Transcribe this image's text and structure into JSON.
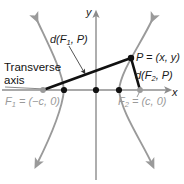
{
  "figure": {
    "colors": {
      "curve": "#9a9a9a",
      "axis": "#8c8c8c",
      "segment": "#111111",
      "focus_dot": "#9a9a9a",
      "vertex_dot": "#111111",
      "label_dark": "#1a1a1a",
      "label_gray": "#9a9a9a",
      "background": "#ffffff"
    },
    "labels": {
      "transverse_axis_line1": "Transverse",
      "transverse_axis_line2": "axis",
      "distance_f1_p": "d(F",
      "distance_f1_p_sub": "1",
      "distance_f1_p_tail": ", P)",
      "point_p": "P = (x, y)",
      "distance_f2_p": "d(F",
      "distance_f2_p_sub": "2",
      "distance_f2_p_tail": ", P)",
      "focus1": "F",
      "focus1_sub": "1",
      "focus1_tail": " = (−c, 0)",
      "focus2": "F",
      "focus2_sub": "2",
      "focus2_tail": " = (c, 0)",
      "axis_y": "y",
      "axis_x": "x"
    },
    "points": {
      "focus1": {
        "name": "F1",
        "coords": "(-c, 0)",
        "px": [
          43,
          90
        ]
      },
      "focus2": {
        "name": "F2",
        "coords": "(c, 0)",
        "px": [
          140,
          90
        ]
      },
      "vertex_left": {
        "px": [
          64,
          90
        ]
      },
      "origin": {
        "px": [
          96,
          90
        ]
      },
      "vertex_right": {
        "px": [
          119,
          90
        ]
      },
      "point_p": {
        "name": "P",
        "coords": "(x, y)",
        "px": [
          131,
          58
        ]
      }
    },
    "segments": [
      {
        "name": "F1-to-P",
        "from": "focus1",
        "to": "point_p"
      },
      {
        "name": "P-to-F2",
        "from": "point_p",
        "to": "focus2"
      }
    ]
  }
}
